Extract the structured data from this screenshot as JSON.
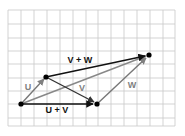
{
  "diagram": {
    "type": "vector-addition-diagram",
    "grid": {
      "color": "#c8c8c8",
      "left": 8,
      "top": 10,
      "right": 175,
      "bottom": 126,
      "cols": 13,
      "rows": 9
    },
    "points": {
      "origin": {
        "x": 21,
        "y": 104
      },
      "u_tip": {
        "x": 46,
        "y": 77
      },
      "uv_tip": {
        "x": 97,
        "y": 104
      },
      "uvw_tip": {
        "x": 149,
        "y": 55
      }
    },
    "vectors": [
      {
        "id": "u",
        "label": "U",
        "from": "origin",
        "to": "u_tip",
        "color": "#777777"
      },
      {
        "id": "v",
        "label": "V",
        "from": "u_tip",
        "to": "uv_tip",
        "color": "#333333"
      },
      {
        "id": "w",
        "label": "W",
        "from": "uv_tip",
        "to": "uvw_tip",
        "color": "#777777"
      },
      {
        "id": "u_plus_v",
        "label": "U + V",
        "from": "origin",
        "to": "uv_tip",
        "color": "#111111"
      },
      {
        "id": "v_plus_w",
        "label": "V + W",
        "from": "u_tip",
        "to": "uvw_tip",
        "color": "#111111"
      },
      {
        "id": "u_plus_v_plus_w",
        "label": "",
        "from": "origin",
        "to": "uvw_tip",
        "color": "#888888"
      }
    ],
    "labels": {
      "u": "U",
      "v": "V",
      "w": "W",
      "u_plus_v": "U + V",
      "v_plus_w": "V + W"
    }
  }
}
